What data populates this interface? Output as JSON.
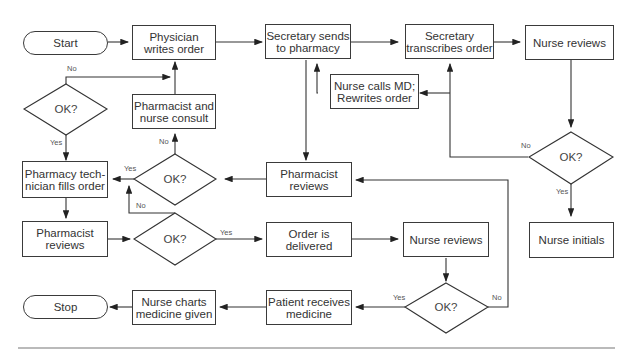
{
  "diagram": {
    "type": "flowchart",
    "terminals": {
      "start": "Start",
      "stop": "Stop"
    },
    "nodes": {
      "physician_writes": "Physician writes order",
      "secretary_sends": "Secretary sends to pharmacy",
      "secretary_transcribes": "Secretary transcribes order",
      "nurse_reviews_top": "Nurse reviews",
      "nurse_calls_md": "Nurse calls MD; Rewrites order",
      "pharmacist_nurse_consult": "Pharmacist and nurse consult",
      "pharmacy_tech_fills": "Pharmacy tech-nician fills order",
      "pharmacist_reviews_mid": "Pharmacist reviews",
      "pharmacist_reviews_low": "Pharmacist reviews",
      "order_delivered": "Order is delivered",
      "nurse_reviews_low": "Nurse reviews",
      "nurse_initials": "Nurse initials",
      "patient_receives": "Patient receives medicine",
      "nurse_charts": "Nurse charts medicine given"
    },
    "decisions": {
      "d_left": "OK?",
      "d_mid": "OK?",
      "d_low": "OK?",
      "d_right": "OK?",
      "d_bottom": "OK?"
    },
    "edge_labels": {
      "yes": "Yes",
      "no": "No"
    }
  }
}
